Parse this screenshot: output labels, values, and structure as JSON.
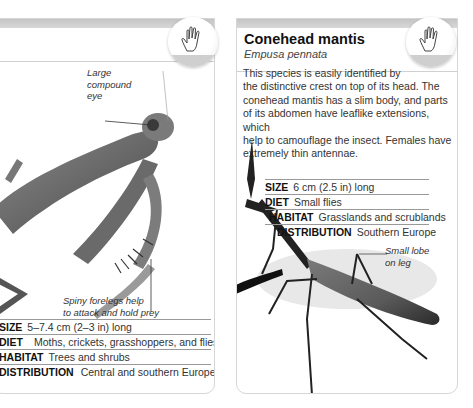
{
  "left_card": {
    "callouts": {
      "eye": "Large compound eye",
      "eye_lines": [
        "Large",
        "compound",
        "eye"
      ],
      "forelegs_lines": [
        "Spiny forelegs help",
        "to attack and hold prey"
      ]
    },
    "facts": [
      {
        "key": "SIZE",
        "value": "5–7.4 cm (2–3 in) long"
      },
      {
        "key": "DIET",
        "value": "Moths, crickets, grasshoppers, and flies"
      },
      {
        "key": "HABITAT",
        "value": "Trees and shrubs"
      },
      {
        "key": "DISTRIBUTION",
        "value": "Central and southern Europe"
      }
    ],
    "badge_icon": "hand-icon"
  },
  "right_card": {
    "title": "Conehead mantis",
    "scientific_name": "Empusa pennata",
    "description": "This species is easily identified by the distinctive crest on top of its head. The conehead mantis has a slim body, and parts of its abdomen have leaflike extensions, which help to camouflage the insect. Females have extremely thin antennae.",
    "description_lines": [
      "This species is easily identified by",
      "the distinctive crest on top of its head. The",
      "conehead mantis has a slim body, and parts",
      "of its abdomen have leaflike extensions, which",
      "help to camouflage the insect. Females have",
      "extremely thin antennae."
    ],
    "facts": [
      {
        "key": "SIZE",
        "value": "6 cm (2.5 in) long"
      },
      {
        "key": "DIET",
        "value": "Small flies"
      },
      {
        "key": "HABITAT",
        "value": "Grasslands and scrublands"
      },
      {
        "key": "DISTRIBUTION",
        "value": "Southern Europe"
      }
    ],
    "callouts": {
      "lobe_lines": [
        "Small lobe",
        "on leg"
      ]
    },
    "badge_icon": "hand-icon"
  }
}
